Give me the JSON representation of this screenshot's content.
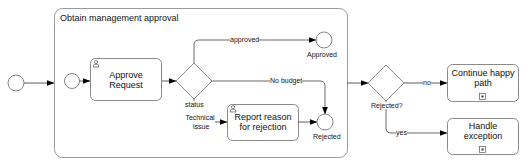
{
  "subprocess": {
    "title": "Obtain management approval"
  },
  "tasks": {
    "approve_request": "Approve Request",
    "report_reason": "Report reason for rejection",
    "continue_happy_path": "Continue happy path",
    "handle_exception": "Handle exception"
  },
  "gateways": {
    "status": "status",
    "rejected": "Rejected?"
  },
  "events": {
    "approved": "Approved",
    "rejected": "Rejected"
  },
  "flows": {
    "approved": "approved",
    "no_budget": "No budget",
    "technical_issue_line1": "Technical",
    "technical_issue_line2": "issue",
    "no": "no",
    "yes": "yes"
  },
  "colors": {
    "stroke": "#6e6e6e",
    "container_stroke": "#9a9a9a",
    "arrow": "#000000"
  }
}
